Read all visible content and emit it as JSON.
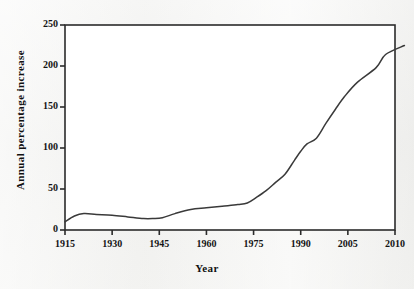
{
  "chart_data": {
    "type": "line",
    "title": "",
    "subtitle": "",
    "xlabel": "Year",
    "ylabel": "Annual percentage increase",
    "xlim": [
      1915,
      2012
    ],
    "ylim": [
      0,
      250
    ],
    "grid": false,
    "legend": "none",
    "xtick_labels": [
      "1915",
      "1930",
      "1945",
      "1960",
      "1975",
      "1990",
      "2005",
      "2010"
    ],
    "xtick_values": [
      1915,
      1930,
      1945,
      1960,
      1975,
      1990,
      2005,
      2010
    ],
    "ytick_labels": [
      "0",
      "50",
      "100",
      "150",
      "200",
      "250"
    ],
    "ytick_values": [
      0,
      50,
      100,
      150,
      200,
      250
    ],
    "line_color": "#3a3a3a",
    "series": [
      {
        "name": "Annual percentage increase",
        "x": [
          1915,
          1918,
          1921,
          1925,
          1930,
          1935,
          1940,
          1943,
          1946,
          1950,
          1955,
          1960,
          1965,
          1970,
          1973,
          1976,
          1979,
          1982,
          1985,
          1988,
          1990,
          1992,
          1995,
          1998,
          2001,
          2004,
          2006,
          2008,
          2009,
          2011
        ],
        "values": [
          10,
          17,
          20,
          19,
          18,
          16,
          14,
          14,
          15,
          20,
          25,
          27,
          29,
          31,
          33,
          40,
          48,
          58,
          68,
          85,
          96,
          105,
          112,
          130,
          147,
          163,
          180,
          198,
          214,
          225
        ]
      }
    ]
  },
  "axes": {
    "x_title": "Year",
    "y_title": "Annual percentage increase"
  }
}
